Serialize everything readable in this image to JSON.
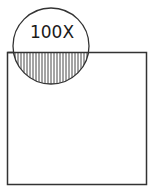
{
  "figure": {
    "magnification_label": "100X",
    "colors": {
      "stroke": "#222222",
      "background": "#ffffff"
    }
  }
}
